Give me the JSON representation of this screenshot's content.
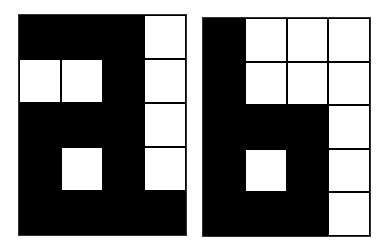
{
  "figure": {
    "colors": {
      "filled": "#000000",
      "empty": "#ffffff",
      "grid_line": "#000000"
    },
    "glyphs": [
      {
        "name": "letter-a",
        "rows": 5,
        "cols": 4,
        "cells": [
          [
            "B",
            "B",
            "B",
            "W"
          ],
          [
            "W",
            "W",
            "B",
            "W"
          ],
          [
            "B",
            "B",
            "B",
            "W"
          ],
          [
            "B",
            "W",
            "B",
            "W"
          ],
          [
            "B",
            "B",
            "B",
            "B"
          ]
        ]
      },
      {
        "name": "letter-b",
        "rows": 5,
        "cols": 4,
        "cells": [
          [
            "B",
            "W",
            "W",
            "W"
          ],
          [
            "B",
            "W",
            "W",
            "W"
          ],
          [
            "B",
            "B",
            "B",
            "W"
          ],
          [
            "B",
            "W",
            "B",
            "W"
          ],
          [
            "B",
            "B",
            "B",
            "W"
          ]
        ]
      }
    ]
  }
}
